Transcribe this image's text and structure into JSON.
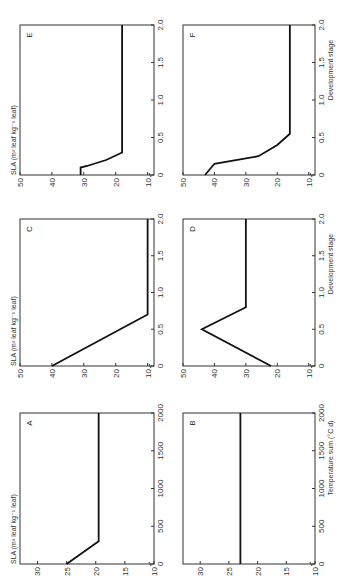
{
  "figure": {
    "orientation": "rotated 90 degrees counter-clockwise",
    "ylabel": "SLA (m² leaf kg⁻¹ leaf)",
    "xlabel_temperature": "Temperature sum (°C d)",
    "xlabel_development": "Development stage"
  },
  "chart_data": [
    {
      "panel": "A",
      "type": "line",
      "xlabel": "Temperature sum (°C d)",
      "ylabel": "SLA (m² leaf kg⁻¹ leaf)",
      "xlim": [
        0,
        2000
      ],
      "ylim": [
        10,
        33
      ],
      "xticks": [
        0,
        500,
        1000,
        1500,
        2000
      ],
      "yticks": [
        10,
        15,
        20,
        25,
        30
      ],
      "x": [
        0,
        300,
        2000
      ],
      "y": [
        25,
        19.5,
        19.5
      ]
    },
    {
      "panel": "B",
      "type": "line",
      "xlabel": "Temperature sum (°C d)",
      "ylabel": "",
      "xlim": [
        0,
        2000
      ],
      "ylim": [
        10,
        33
      ],
      "xticks": [
        0,
        500,
        1000,
        1500,
        2000
      ],
      "yticks": [
        10,
        15,
        20,
        25,
        30
      ],
      "x": [
        0,
        2000
      ],
      "y": [
        23,
        23
      ]
    },
    {
      "panel": "C",
      "type": "line",
      "xlabel": "Development stage",
      "ylabel": "SLA (m² leaf kg⁻¹ leaf)",
      "xlim": [
        0,
        2.0
      ],
      "ylim": [
        8,
        50
      ],
      "xticks": [
        0,
        0.5,
        1.0,
        1.5,
        2.0
      ],
      "yticks": [
        10,
        20,
        30,
        40,
        50
      ],
      "x": [
        0,
        0.7,
        2.0
      ],
      "y": [
        40,
        10,
        10
      ]
    },
    {
      "panel": "D",
      "type": "line",
      "xlabel": "Development stage",
      "ylabel": "",
      "xlim": [
        0,
        2.0
      ],
      "ylim": [
        8,
        50
      ],
      "xticks": [
        0,
        0.5,
        1.0,
        1.5,
        2.0
      ],
      "yticks": [
        10,
        20,
        30,
        40,
        50
      ],
      "x": [
        0,
        0.5,
        0.8,
        2.0
      ],
      "y": [
        22,
        44,
        30,
        30
      ]
    },
    {
      "panel": "E",
      "type": "line",
      "xlabel": "Development stage",
      "ylabel": "SLA (m² leaf kg⁻¹ leaf)",
      "xlim": [
        0,
        2.0
      ],
      "ylim": [
        8,
        50
      ],
      "xticks": [
        0,
        0.5,
        1.0,
        1.5,
        2.0
      ],
      "yticks": [
        10,
        20,
        30,
        40,
        50
      ],
      "x": [
        0,
        0.1,
        0.12,
        0.2,
        0.3,
        2.0
      ],
      "y": [
        31,
        31,
        29,
        23,
        18,
        18
      ]
    },
    {
      "panel": "F",
      "type": "line",
      "xlabel": "Development stage",
      "ylabel": "",
      "xlim": [
        0,
        2.0
      ],
      "ylim": [
        8,
        50
      ],
      "xticks": [
        0,
        0.5,
        1.0,
        1.5,
        2.0
      ],
      "yticks": [
        10,
        20,
        30,
        40,
        50
      ],
      "x": [
        0,
        0.15,
        0.25,
        0.4,
        0.55,
        2.0
      ],
      "y": [
        43,
        40,
        26,
        20,
        16,
        16
      ]
    }
  ]
}
